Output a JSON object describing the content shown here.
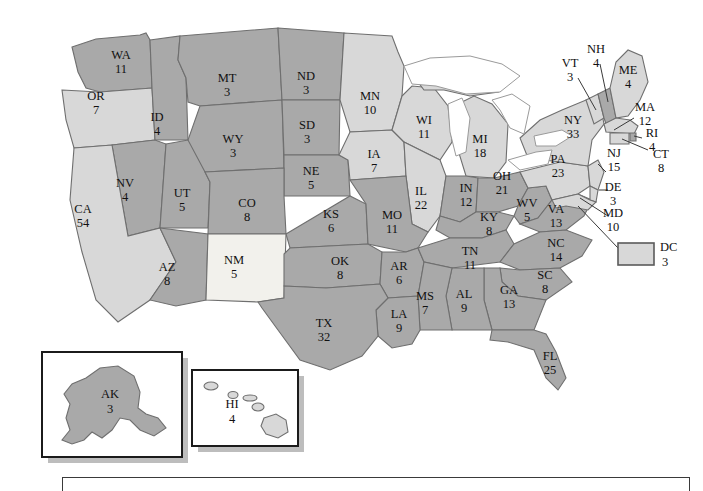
{
  "map": {
    "title": "United States Electoral College Map",
    "colors": {
      "dark_state": "#a9a9a9",
      "light_state": "#d8d8d8",
      "very_light_state": "#f2f1ec",
      "border": "#6f6f6f",
      "water": "#ffffff",
      "text": "#1a1a1a",
      "inset_border": "#1b1b1b",
      "inset_shadow": "#bdbdbd"
    },
    "states": [
      {
        "code": "WA",
        "votes": "11",
        "shade": "dark",
        "lx": 121,
        "ly": 59
      },
      {
        "code": "OR",
        "votes": "7",
        "shade": "light",
        "lx": 96,
        "ly": 100
      },
      {
        "code": "ID",
        "votes": "4",
        "shade": "dark",
        "lx": 157,
        "ly": 121
      },
      {
        "code": "MT",
        "votes": "3",
        "shade": "dark",
        "lx": 227,
        "ly": 82
      },
      {
        "code": "WY",
        "votes": "3",
        "shade": "dark",
        "lx": 233,
        "ly": 143
      },
      {
        "code": "ND",
        "votes": "3",
        "shade": "dark",
        "lx": 306,
        "ly": 80
      },
      {
        "code": "SD",
        "votes": "3",
        "shade": "dark",
        "lx": 307,
        "ly": 129
      },
      {
        "code": "NE",
        "votes": "5",
        "shade": "dark",
        "lx": 311,
        "ly": 175
      },
      {
        "code": "MN",
        "votes": "10",
        "shade": "light",
        "lx": 370,
        "ly": 100
      },
      {
        "code": "IA",
        "votes": "7",
        "shade": "light",
        "lx": 374,
        "ly": 158
      },
      {
        "code": "WI",
        "votes": "11",
        "shade": "light",
        "lx": 424,
        "ly": 124
      },
      {
        "code": "MI",
        "votes": "18",
        "shade": "light",
        "lx": 480,
        "ly": 143
      },
      {
        "code": "IL",
        "votes": "22",
        "shade": "light",
        "lx": 421,
        "ly": 195
      },
      {
        "code": "IN",
        "votes": "12",
        "shade": "dark",
        "lx": 466,
        "ly": 192
      },
      {
        "code": "OH",
        "votes": "21",
        "shade": "dark",
        "lx": 502,
        "ly": 180
      },
      {
        "code": "NV",
        "votes": "4",
        "shade": "dark",
        "lx": 125,
        "ly": 187
      },
      {
        "code": "UT",
        "votes": "5",
        "shade": "dark",
        "lx": 182,
        "ly": 197
      },
      {
        "code": "CO",
        "votes": "8",
        "shade": "dark",
        "lx": 247,
        "ly": 207
      },
      {
        "code": "KS",
        "votes": "6",
        "shade": "dark",
        "lx": 331,
        "ly": 218
      },
      {
        "code": "MO",
        "votes": "11",
        "shade": "dark",
        "lx": 392,
        "ly": 219
      },
      {
        "code": "KY",
        "votes": "8",
        "shade": "dark",
        "lx": 489,
        "ly": 221
      },
      {
        "code": "WV",
        "votes": "5",
        "shade": "dark",
        "lx": 527,
        "ly": 207
      },
      {
        "code": "VA",
        "votes": "13",
        "shade": "dark",
        "lx": 556,
        "ly": 213
      },
      {
        "code": "CA",
        "votes": "54",
        "shade": "light",
        "lx": 83,
        "ly": 213
      },
      {
        "code": "AZ",
        "votes": "8",
        "shade": "dark",
        "lx": 167,
        "ly": 271
      },
      {
        "code": "NM",
        "votes": "5",
        "shade": "vlight",
        "lx": 234,
        "ly": 264
      },
      {
        "code": "OK",
        "votes": "8",
        "shade": "dark",
        "lx": 340,
        "ly": 265
      },
      {
        "code": "AR",
        "votes": "6",
        "shade": "dark",
        "lx": 399,
        "ly": 270
      },
      {
        "code": "TN",
        "votes": "11",
        "shade": "dark",
        "lx": 470,
        "ly": 255
      },
      {
        "code": "NC",
        "votes": "14",
        "shade": "dark",
        "lx": 556,
        "ly": 247
      },
      {
        "code": "SC",
        "votes": "8",
        "shade": "dark",
        "lx": 545,
        "ly": 279
      },
      {
        "code": "GA",
        "votes": "13",
        "shade": "dark",
        "lx": 509,
        "ly": 294
      },
      {
        "code": "AL",
        "votes": "9",
        "shade": "dark",
        "lx": 464,
        "ly": 298
      },
      {
        "code": "MS",
        "votes": "7",
        "shade": "dark",
        "lx": 425,
        "ly": 300
      },
      {
        "code": "LA",
        "votes": "9",
        "shade": "dark",
        "lx": 399,
        "ly": 318
      },
      {
        "code": "TX",
        "votes": "32",
        "shade": "dark",
        "lx": 324,
        "ly": 327
      },
      {
        "code": "FL",
        "votes": "25",
        "shade": "dark",
        "lx": 550,
        "ly": 360
      },
      {
        "code": "PA",
        "votes": "23",
        "shade": "light",
        "lx": 558,
        "ly": 163
      },
      {
        "code": "NY",
        "votes": "33",
        "shade": "light",
        "lx": 573,
        "ly": 124
      },
      {
        "code": "VT",
        "votes": "3",
        "shade": "light",
        "lx": 570,
        "ly": 67
      },
      {
        "code": "NH",
        "votes": "4",
        "shade": "dark",
        "lx": 596,
        "ly": 53
      },
      {
        "code": "ME",
        "votes": "4",
        "shade": "light",
        "lx": 628,
        "ly": 74
      },
      {
        "code": "MA",
        "votes": "12",
        "shade": "light",
        "lx": 645,
        "ly": 111
      },
      {
        "code": "RI",
        "votes": "4",
        "shade": "dark",
        "lx": 652,
        "ly": 137
      },
      {
        "code": "CT",
        "votes": "8",
        "shade": "light",
        "lx": 661,
        "ly": 158
      },
      {
        "code": "NJ",
        "votes": "15",
        "shade": "light",
        "lx": 614,
        "ly": 157
      },
      {
        "code": "DE",
        "votes": "3",
        "shade": "light",
        "lx": 613,
        "ly": 191
      },
      {
        "code": "MD",
        "votes": "10",
        "shade": "light",
        "lx": 613,
        "ly": 217
      },
      {
        "code": "AK",
        "votes": "3",
        "shade": "dark",
        "lx": 110,
        "ly": 397
      },
      {
        "code": "HI",
        "votes": "4",
        "shade": "light",
        "lx": 232,
        "ly": 407
      }
    ],
    "dc_legend": {
      "code": "DC",
      "votes": "3",
      "shade": "light"
    },
    "insets": [
      {
        "name": "alaska-inset",
        "label": "AK"
      },
      {
        "name": "hawaii-inset",
        "label": "HI"
      }
    ]
  }
}
